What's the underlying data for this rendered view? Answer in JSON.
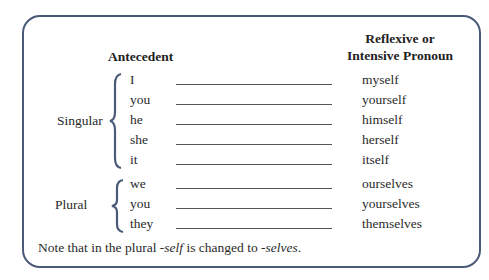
{
  "headers": {
    "antecedent": "Antecedent",
    "pronoun_line1": "Reflexive or",
    "pronoun_line2": "Intensive Pronoun"
  },
  "groups": [
    {
      "label": "Singular",
      "rows": [
        {
          "antecedent": "I",
          "pronoun": "myself"
        },
        {
          "antecedent": "you",
          "pronoun": "yourself"
        },
        {
          "antecedent": "he",
          "pronoun": "himself"
        },
        {
          "antecedent": "she",
          "pronoun": "herself"
        },
        {
          "antecedent": "it",
          "pronoun": "itself"
        }
      ]
    },
    {
      "label": "Plural",
      "rows": [
        {
          "antecedent": "we",
          "pronoun": "ourselves"
        },
        {
          "antecedent": "you",
          "pronoun": "yourselves"
        },
        {
          "antecedent": "they",
          "pronoun": "themselves"
        }
      ]
    }
  ],
  "note": {
    "prefix": "Note that in the plural ",
    "term1": "-self",
    "middle": " is changed to ",
    "term2": "-selves",
    "suffix": "."
  },
  "colors": {
    "border": "#4a5a78",
    "brace": "#4a5a78"
  }
}
